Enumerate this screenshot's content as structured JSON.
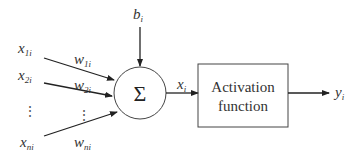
{
  "diagram": {
    "type": "artificial-neuron-model",
    "bias": {
      "label": "b",
      "sub": "i"
    },
    "inputs": [
      {
        "label": "x",
        "sub": "1i",
        "weight_label": "w",
        "weight_sub": "1i"
      },
      {
        "label": "x",
        "sub": "2i",
        "weight_label": "w",
        "weight_sub": "2i"
      },
      {
        "label": "x",
        "sub": "ni",
        "weight_label": "w",
        "weight_sub": "ni"
      }
    ],
    "ellipsis": "⋮",
    "summation": {
      "symbol": "Σ"
    },
    "net_input": {
      "label": "x",
      "sub": "i"
    },
    "activation_box": {
      "line1": "Activation",
      "line2": "function"
    },
    "output": {
      "label": "y",
      "sub": "i"
    },
    "colors": {
      "stroke": "#222222",
      "text": "#333333",
      "background": "#ffffff"
    }
  }
}
